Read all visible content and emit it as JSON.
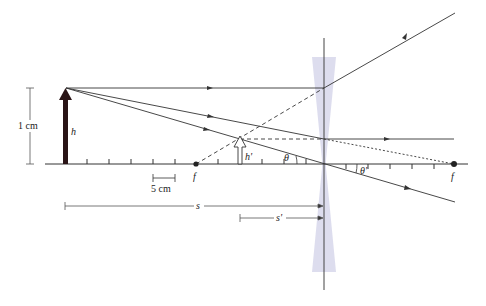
{
  "diagram": {
    "type": "ray-diagram-diverging-lens",
    "colors": {
      "line": "#333333",
      "object_arrow": "#2a1416",
      "lens_fill": "#d9d9ec",
      "axis": "#333333"
    },
    "labels": {
      "scale_bar": "1 cm",
      "object_height": "h",
      "image_height": "h'",
      "focal_left": "f",
      "focal_right": "f",
      "scale_5cm": "5 cm",
      "object_distance": "s",
      "image_distance": "s'",
      "angle_left": "θ",
      "angle_right": "θ'"
    },
    "elements": {
      "optical_axis": "horizontal axis with tick marks",
      "lens": "diverging (concave) lens",
      "object": "upright arrow of height h",
      "image": "upright virtual image arrow of height h'",
      "rays": [
        "parallel ray refracted away from near focal point",
        "ray toward far focal point refracted parallel",
        "central ray through lens center undeviated"
      ]
    }
  }
}
